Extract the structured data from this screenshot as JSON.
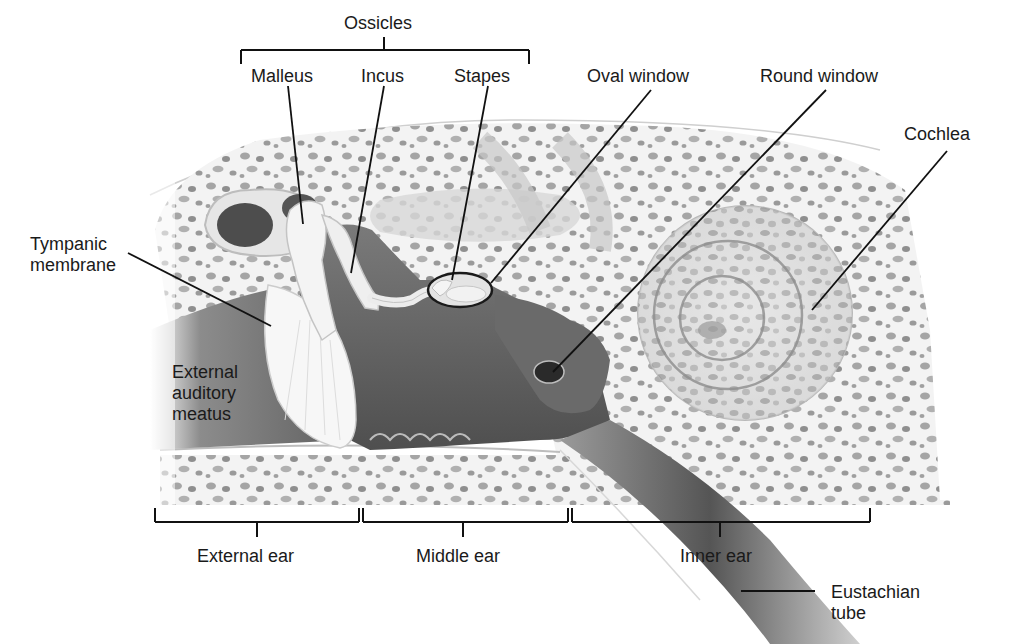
{
  "diagram": {
    "group_labels": {
      "ossicles": "Ossicles"
    },
    "labels": {
      "malleus": "Malleus",
      "incus": "Incus",
      "stapes": "Stapes",
      "oval_window": "Oval window",
      "round_window": "Round window",
      "cochlea": "Cochlea",
      "tympanic_membrane": [
        "Tympanic",
        "membrane"
      ],
      "external_auditory_meatus": [
        "External",
        "auditory",
        "meatus"
      ],
      "eustachian_tube": [
        "Eustachian",
        "tube"
      ]
    },
    "regions": {
      "external_ear": "External ear",
      "middle_ear": "Middle ear",
      "inner_ear": "Inner ear"
    },
    "colors": {
      "background": "#ffffff",
      "text": "#1a1a1a",
      "leader_line": "#111111",
      "bone": "#f2f2f2",
      "bone_pore": "#9a9a9a",
      "canal_dark": "#6e6e6e",
      "membrane": "#f7f7f7"
    }
  }
}
